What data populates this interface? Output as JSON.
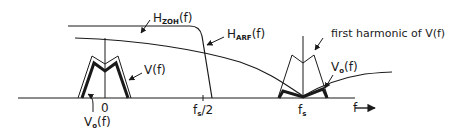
{
  "diagram": {
    "title": "",
    "labels": {
      "h_zoh": {
        "main": "H",
        "sub": "ZOH",
        "arg": "(f)"
      },
      "h_arf": {
        "main": "H",
        "sub": "ARF",
        "arg": "(f)"
      },
      "v_f": "V(f)",
      "vo_left": {
        "main": "V",
        "sub": "o",
        "arg": "(f)"
      },
      "vo_right": {
        "main": "V",
        "sub": "o",
        "arg": "(f)"
      },
      "first_harmonic": "first harmonic of V(f)",
      "zero_tick": "0",
      "fs_half": {
        "main": "f",
        "sub": "s",
        "arg": "/2"
      },
      "fs": {
        "main": "f",
        "sub": "s"
      },
      "f_axis": "f"
    },
    "colors": {
      "line": "#1a1a1a",
      "background": "#ffffff"
    }
  }
}
